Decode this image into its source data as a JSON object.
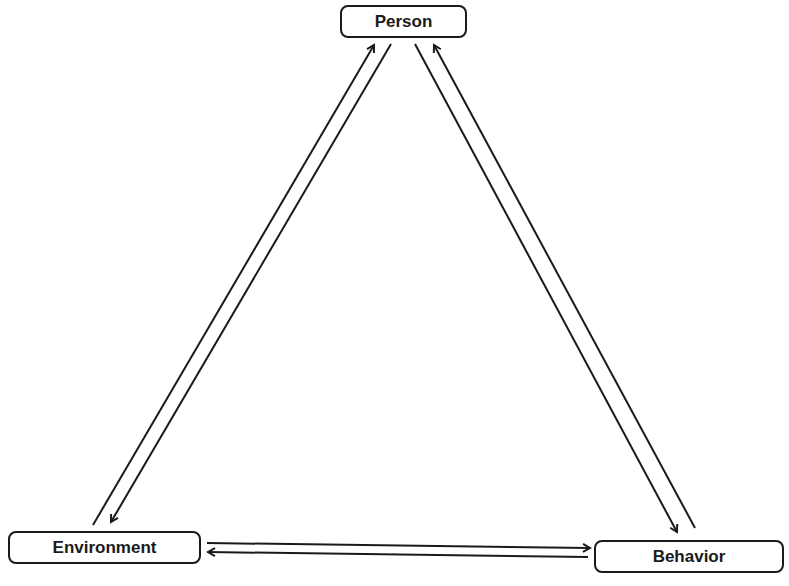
{
  "diagram": {
    "nodes": [
      {
        "id": "person",
        "label": "Person"
      },
      {
        "id": "environment",
        "label": "Environment"
      },
      {
        "id": "behavior",
        "label": "Behavior"
      }
    ],
    "edges": [
      {
        "from": "environment",
        "to": "person"
      },
      {
        "from": "person",
        "to": "environment"
      },
      {
        "from": "person",
        "to": "behavior"
      },
      {
        "from": "behavior",
        "to": "person"
      },
      {
        "from": "environment",
        "to": "behavior"
      },
      {
        "from": "behavior",
        "to": "environment"
      }
    ],
    "colors": {
      "stroke": "#1a1a1a",
      "background": "#ffffff"
    }
  }
}
